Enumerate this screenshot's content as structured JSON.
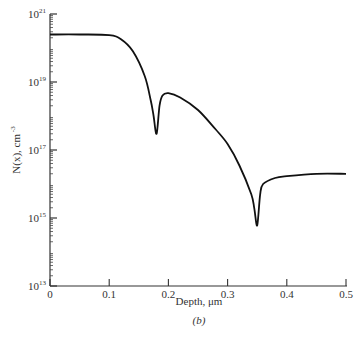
{
  "chart_data": {
    "type": "line",
    "title": "",
    "caption": "(b)",
    "xlabel": "Depth, μm",
    "ylabel": "N(x), cm^-3",
    "yscale": "log",
    "xlim": [
      0,
      0.5
    ],
    "ylim": [
      10000000000000.0,
      1e+21
    ],
    "xticks": [
      "0",
      "0.1",
      "0.2",
      "0.3",
      "0.4",
      "0.5"
    ],
    "yticks": [
      {
        "base": "10",
        "exp": "21"
      },
      {
        "base": "10",
        "exp": "19"
      },
      {
        "base": "10",
        "exp": "17"
      },
      {
        "base": "10",
        "exp": "15"
      },
      {
        "base": "10",
        "exp": "13"
      }
    ],
    "grid": false,
    "legend": null,
    "series": [
      {
        "name": "Net doping profile",
        "x": [
          0.0,
          0.05,
          0.1,
          0.12,
          0.14,
          0.16,
          0.17,
          0.175,
          0.18,
          0.185,
          0.19,
          0.2,
          0.22,
          0.25,
          0.28,
          0.3,
          0.32,
          0.34,
          0.345,
          0.35,
          0.355,
          0.36,
          0.38,
          0.4,
          0.45,
          0.5
        ],
        "y": [
          2.5e+20,
          2.5e+20,
          2.4e+20,
          1.8e+20,
          8e+19,
          1.5e+19,
          3e+18,
          1e+18,
          3e+17,
          2e+18,
          4e+18,
          4.7e+18,
          3.5e+18,
          1.5e+18,
          4e+17,
          1.5e+17,
          3.5e+16,
          5000000000000000.0,
          2000000000000000.0,
          600000000000000.0,
          5000000000000000.0,
          1e+16,
          1.5e+16,
          1.7e+16,
          2e+16,
          2e+16
        ]
      }
    ]
  }
}
